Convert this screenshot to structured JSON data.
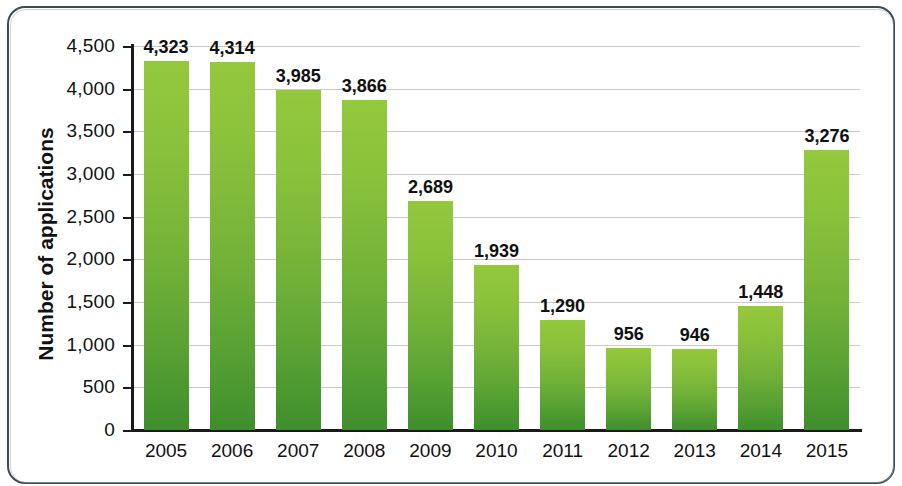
{
  "frame": {
    "border_color": "#3d4b52",
    "inner_border_color": "#9fb0b8"
  },
  "chart_data": {
    "type": "bar",
    "title": "",
    "subtitle": "",
    "xlabel": "",
    "ylabel": "Number of applications",
    "categories": [
      "2005",
      "2006",
      "2007",
      "2008",
      "2009",
      "2010",
      "2011",
      "2012",
      "2013",
      "2014",
      "2015"
    ],
    "values": [
      4323,
      4314,
      3985,
      3866,
      2689,
      1939,
      1290,
      956,
      946,
      1448,
      3276
    ],
    "value_labels": [
      "4,323",
      "4,314",
      "3,985",
      "3,866",
      "2,689",
      "1,939",
      "1,290",
      "956",
      "946",
      "1,448",
      "3,276"
    ],
    "ylim": [
      0,
      4500
    ],
    "ytick_values": [
      0,
      500,
      1000,
      1500,
      2000,
      2500,
      3000,
      3500,
      4000,
      4500
    ],
    "ytick_labels": [
      "0",
      "500",
      "1,000",
      "1,500",
      "2,000",
      "2,500",
      "3,000",
      "3,500",
      "4,000",
      "4,500"
    ],
    "grid": true,
    "grid_color": "#c9c9c9",
    "legend": null,
    "legend_position": "none",
    "bar_color_top": "#94c83d",
    "bar_color_bottom": "#3f8e2c",
    "axis_color": "#1a1a1a",
    "series": [
      {
        "name": "Number of applications",
        "values": [
          4323,
          4314,
          3985,
          3866,
          2689,
          1939,
          1290,
          956,
          946,
          1448,
          3276
        ]
      }
    ]
  }
}
